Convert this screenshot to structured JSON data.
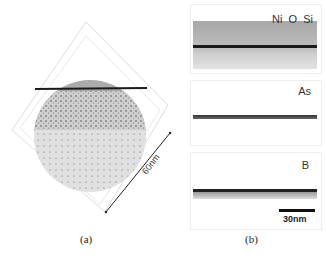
{
  "figure": {
    "panel_a": {
      "caption": "(a)",
      "scale_label": "60nm",
      "description": "3D atom probe reconstruction, spherical tip with horizontal interface"
    },
    "panel_b": {
      "caption": "(b)",
      "slices": [
        {
          "label": "Ni  O  Si"
        },
        {
          "label": "As"
        },
        {
          "label": "B"
        }
      ],
      "scale_bar_label": "30nm"
    }
  },
  "colors": {
    "upper_region": "#a9a9a9",
    "lower_region": "#d4d4d4",
    "interface": "#1a1a1a",
    "box_lines": "#dddddd"
  }
}
